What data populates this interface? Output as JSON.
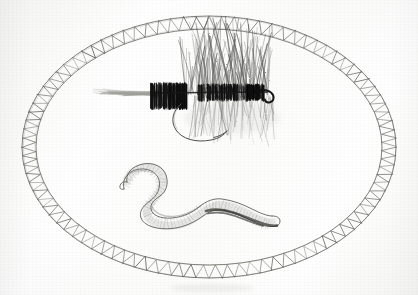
{
  "artwork": {
    "title": "Fishing Fly and Earthworm in Oval Frame",
    "medium": "Graphite and ink pencil drawing on white paper",
    "orientation": "landscape",
    "canvas_width": 418,
    "canvas_height": 295,
    "background_color": "#fdfdfc",
    "ink_color": "#3a3a38",
    "dark_ink_color": "#111111",
    "light_pencil_color": "#8e8e8a",
    "description": "A hand-drawn pencil sketch showing an artificial fishing fly (dry fly with dark body, bushy hackle, long tail fibers and a curved hook) above a segmented earthworm, both enclosed inside a decorative oval border made of two concentric ellipse lines with zigzag ladder rungs between them."
  },
  "frame": {
    "label": "Decorative oval frame",
    "shape": "ellipse",
    "center_x": 209,
    "center_y": 147,
    "outer_radius_x": 187,
    "outer_radius_y": 131,
    "inner_radius_x": 173,
    "inner_radius_y": 118,
    "rung_count": 92,
    "rung_style": "zigzag-U",
    "stroke_color": "#55554f",
    "stroke_width": 0.8
  },
  "subjects": [
    {
      "id": "fishing-fly",
      "name": "Artificial fishing fly",
      "type": "dry fly",
      "position": {
        "x": 200,
        "y": 95
      },
      "parts": [
        {
          "name": "tail fibers",
          "note": "long sweeping light fibers to the lower left",
          "color": "#7a7a76"
        },
        {
          "name": "rear dark band",
          "note": "dense black thread wrap",
          "color": "#111111"
        },
        {
          "name": "body",
          "note": "dark segmented body along the hook shank",
          "color": "#1a1a1a"
        },
        {
          "name": "hackle",
          "note": "bushy fibers radiating up and down from the body",
          "color": "#3c3c3a"
        },
        {
          "name": "head",
          "note": "black thread head near the hook eye",
          "color": "#0d0d0d"
        },
        {
          "name": "hook",
          "note": "curved wire hook descending below the body with upturned point",
          "color": "#43433f"
        },
        {
          "name": "hook eye",
          "note": "small loop turning down at the right",
          "color": "#161616"
        }
      ]
    },
    {
      "id": "earthworm",
      "name": "Earthworm",
      "type": "nightcrawler bait",
      "position": {
        "x": 205,
        "y": 192
      },
      "parts": [
        {
          "name": "head",
          "note": "pointed prostomium at the left end",
          "color": "#6d6d68"
        },
        {
          "name": "body",
          "note": "S-curved tubular body with ring segment lines",
          "color": "#7b7b76"
        },
        {
          "name": "shading",
          "note": "dark graphite shading along the lower edge",
          "color": "#2e2e2c"
        },
        {
          "name": "tail",
          "note": "blunt rounded tail at the right end",
          "color": "#5c5c58"
        }
      ]
    }
  ],
  "annotations": {
    "text_present": false,
    "signature_present": false,
    "caption": ""
  }
}
